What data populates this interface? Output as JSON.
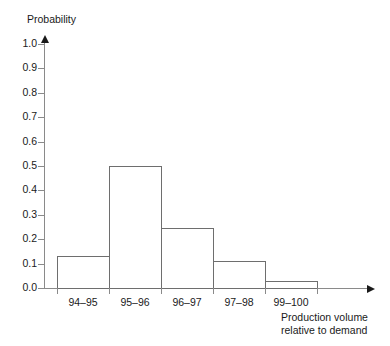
{
  "chart_data": {
    "type": "bar",
    "title": "",
    "subtitle": "",
    "ylabel": "Probability",
    "xlabel": "Production volume relative to demand",
    "xlabel_line1": "Production volume",
    "xlabel_line2": "relative to demand",
    "categories": [
      "94–95",
      "95–96",
      "96–97",
      "97–98",
      "99–100"
    ],
    "values": [
      0.13,
      0.5,
      0.245,
      0.11,
      0.03
    ],
    "ylim": [
      0.0,
      1.0
    ],
    "ytick_values": [
      0.0,
      0.1,
      0.2,
      0.3,
      0.4,
      0.5,
      0.6,
      0.7,
      0.8,
      0.9,
      1.0
    ],
    "ytick_labels": [
      "0.0",
      "0.1",
      "0.2",
      "0.3",
      "0.4",
      "0.5",
      "0.6",
      "0.7",
      "0.8",
      "0.9",
      "1.0"
    ],
    "grid": false,
    "legend": false,
    "legend_position": "none",
    "bar_fill_color": "#ffffff",
    "bar_edge_color": "#6e6e6e",
    "axis_color": "#8a8a8a",
    "text_color": "#1a1a1a",
    "background_color": "#ffffff"
  }
}
